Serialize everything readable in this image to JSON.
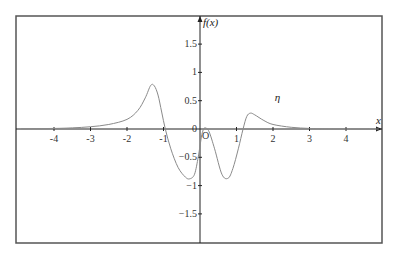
{
  "chart_data": {
    "type": "line",
    "title": "",
    "xlabel": "x",
    "ylabel": "f(x)",
    "xlim": [
      -4.9,
      5.1
    ],
    "ylim": [
      -2.0,
      2.0
    ],
    "x_ticks": [
      -4,
      -3,
      -2,
      -1,
      1,
      2,
      3,
      4
    ],
    "x_tick_labels": [
      "-4",
      "-3",
      "-2",
      "-1",
      "1",
      "2",
      "3",
      "4"
    ],
    "y_ticks": [
      1.5,
      1,
      0.5,
      0,
      -0.5,
      -1,
      -1.5
    ],
    "y_tick_labels": [
      "1.5",
      "1",
      "0.5",
      "0",
      "−0.5",
      "−1",
      "−1.5"
    ],
    "origin_label": "O",
    "grid": false,
    "legend": null,
    "annotations": [
      {
        "text": "η",
        "x": 2.05,
        "y": 0.49
      }
    ],
    "series": [
      {
        "name": "η",
        "color": "#8a8a8a",
        "x": [
          -4.9,
          -4.0,
          -3.5,
          -3.0,
          -2.5,
          -2.0,
          -1.7,
          -1.5,
          -1.35,
          -1.25,
          -1.15,
          -1.05,
          -0.95,
          -0.8,
          -0.6,
          -0.4,
          -0.28,
          -0.15,
          -0.05,
          0.0,
          0.05,
          0.1,
          0.15,
          0.25,
          0.4,
          0.6,
          0.77,
          0.9,
          1.05,
          1.18,
          1.28,
          1.38,
          1.5,
          1.75,
          2.0,
          2.5,
          3.0,
          3.5,
          4.9
        ],
        "y": [
          0.005,
          0.01,
          0.02,
          0.04,
          0.08,
          0.17,
          0.33,
          0.55,
          0.77,
          0.76,
          0.6,
          0.3,
          0.0,
          -0.35,
          -0.68,
          -0.85,
          -0.88,
          -0.8,
          -0.5,
          -0.3,
          -0.1,
          0.0,
          0.02,
          -0.05,
          -0.35,
          -0.8,
          -0.87,
          -0.7,
          -0.35,
          0.0,
          0.22,
          0.28,
          0.25,
          0.15,
          0.08,
          0.03,
          0.01,
          0.0,
          0.0
        ]
      }
    ]
  },
  "layout": {
    "frame": {
      "left": 16,
      "top": 16,
      "right": 382,
      "bottom": 243
    },
    "origin_px": {
      "x": 200,
      "y": 129
    },
    "px_per_unit_x": 36.5,
    "px_per_unit_y": 56.6,
    "frame_color": "#555555",
    "axis_color": "#222222"
  }
}
